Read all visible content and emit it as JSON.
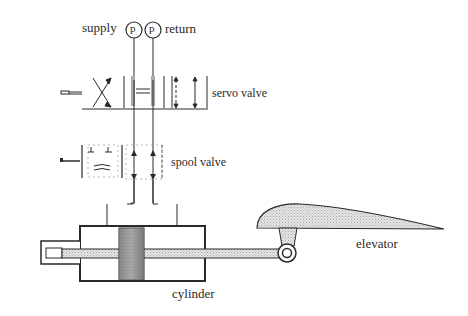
{
  "labels": {
    "supply": "supply",
    "return": "return",
    "servo_valve": "servo valve",
    "spool_valve": "spool valve",
    "cylinder": "cylinder",
    "elevator": "elevator",
    "pressure_gauge_symbol": "p"
  },
  "components": [
    {
      "id": "supply-gauge",
      "type": "pressure-gauge",
      "label": "p"
    },
    {
      "id": "return-gauge",
      "type": "pressure-gauge",
      "label": "p"
    },
    {
      "id": "servo-valve",
      "type": "valve",
      "label": "servo valve"
    },
    {
      "id": "spool-valve",
      "type": "valve",
      "label": "spool valve"
    },
    {
      "id": "cylinder",
      "type": "hydraulic-cylinder",
      "label": "cylinder"
    },
    {
      "id": "elevator",
      "type": "control-surface",
      "label": "elevator"
    }
  ],
  "connections": [
    {
      "from": "supply-gauge",
      "to": "servo-valve"
    },
    {
      "from": "return-gauge",
      "to": "servo-valve"
    },
    {
      "from": "servo-valve",
      "to": "spool-valve"
    },
    {
      "from": "spool-valve",
      "to": "cylinder"
    },
    {
      "from": "cylinder",
      "to": "elevator",
      "via": "piston rod"
    }
  ],
  "colors": {
    "line": "#2a2a2a",
    "fill_light": "#d9d9d9",
    "fill_dark": "#7a7a7a",
    "background": "#ffffff"
  }
}
